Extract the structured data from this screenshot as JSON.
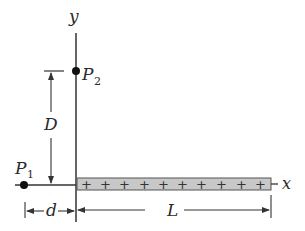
{
  "labels": {
    "y_axis": "y",
    "x_axis": "x",
    "P1": "P",
    "P1_sub": "1",
    "P2": "P",
    "P2_sub": "2",
    "D": "D",
    "d": "d",
    "L": "L"
  },
  "rod": {
    "charge_sign": "+",
    "plus_count": 10,
    "fill_color": "#c8c8c8",
    "stroke_color": "#555555"
  },
  "colors": {
    "line": "#333333",
    "point": "#111111"
  }
}
